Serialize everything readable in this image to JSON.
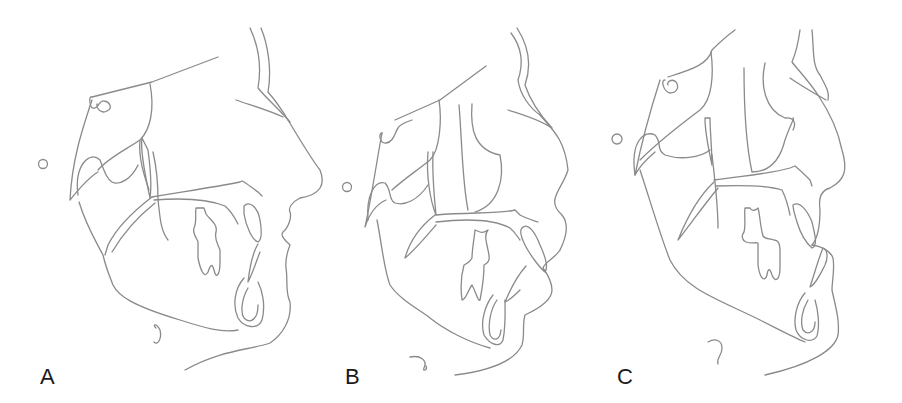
{
  "figure": {
    "line_color": "#8a8a8a",
    "panels": [
      {
        "label": "A"
      },
      {
        "label": "B"
      },
      {
        "label": "C"
      }
    ]
  }
}
